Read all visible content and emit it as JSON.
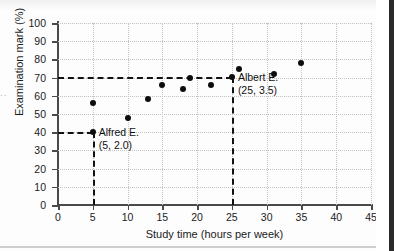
{
  "chart_data": {
    "type": "scatter",
    "title": "",
    "xlabel": "Study time (hours per week)",
    "ylabel": "Examination mark (%)",
    "xlim": [
      0,
      45
    ],
    "ylim": [
      0,
      100
    ],
    "xticks": [
      0,
      5,
      10,
      15,
      20,
      25,
      30,
      35,
      40,
      45
    ],
    "yticks": [
      0,
      10,
      20,
      30,
      40,
      50,
      60,
      70,
      80,
      90,
      100
    ],
    "grid": true,
    "legend": "none",
    "points": [
      {
        "x": 5,
        "y": 40
      },
      {
        "x": 5,
        "y": 56
      },
      {
        "x": 10,
        "y": 48
      },
      {
        "x": 13,
        "y": 58
      },
      {
        "x": 15,
        "y": 66
      },
      {
        "x": 18,
        "y": 64
      },
      {
        "x": 19,
        "y": 70
      },
      {
        "x": 22,
        "y": 66
      },
      {
        "x": 25,
        "y": 70.5
      },
      {
        "x": 26,
        "y": 74.5
      },
      {
        "x": 31,
        "y": 72
      },
      {
        "x": 35,
        "y": 78
      }
    ],
    "annotations": [
      {
        "name": "Alfred E.",
        "coords": "(5, 2.0)",
        "point": {
          "x": 5,
          "y": 40
        },
        "leader": {
          "from_y_axis": true,
          "to_x_axis": true
        }
      },
      {
        "name": "Albert E.",
        "coords": "(25, 3.5)",
        "point": {
          "x": 25,
          "y": 70.5
        },
        "leader": {
          "from_y_axis": true,
          "to_x_axis": true
        }
      }
    ],
    "guide_lines": [
      {
        "type": "horizontal",
        "y": 70.5,
        "from_x": 0,
        "to_x": 25
      },
      {
        "type": "vertical",
        "x": 25,
        "from_y": 0,
        "to_y": 70.5
      },
      {
        "type": "horizontal",
        "y": 40,
        "from_x": 0,
        "to_x": 5
      },
      {
        "type": "vertical",
        "x": 5,
        "from_y": 0,
        "to_y": 40
      }
    ]
  },
  "scan": {
    "left_fragment": ". ."
  },
  "colors": {
    "point": "#0d0d0d",
    "axis": "#4a4a4a",
    "grid": "#c2c2c2",
    "dash": "#111111",
    "text": "#1b1b1b",
    "background": "#fdfdfd"
  }
}
